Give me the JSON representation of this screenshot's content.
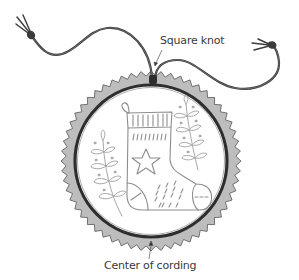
{
  "diagram": {
    "labels": {
      "square_knot": "Square knot",
      "center_of_cording": "Center of cording"
    },
    "colors": {
      "cord": "#3b3b3b",
      "pinked_fabric": "#bdbdbd",
      "hoop_ring": "#2e2e2e",
      "embroidery_stitch": "#8e8e8e",
      "inner_fabric": "#ffffff"
    },
    "parts": [
      "cord",
      "square-knot",
      "pinked-fabric-edge",
      "hoop-ring",
      "stocking",
      "star",
      "left-branch",
      "right-branch",
      "leader-lines"
    ]
  }
}
